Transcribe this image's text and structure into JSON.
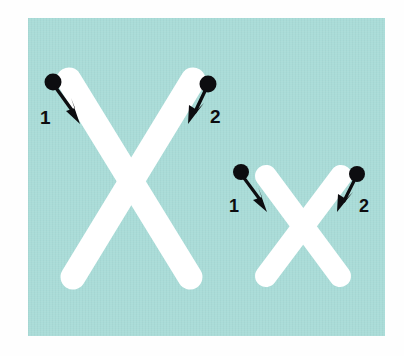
{
  "diagram": {
    "panel_color": "#a9dcd8",
    "letter_color": "#ffffff",
    "ink_color": "#0d0d10",
    "page_background": "#fefefe",
    "letters": [
      {
        "name": "uppercase-x",
        "glyph": "X",
        "case": "uppercase",
        "strokes": [
          {
            "number": "1",
            "label": "1",
            "direction": "down-right",
            "start_dot": [
              53,
              82
            ],
            "tip": [
              79,
              121
            ],
            "label_pos": [
              40,
              117
            ]
          },
          {
            "number": "2",
            "label": "2",
            "direction": "down-left",
            "start_dot": [
              207,
              84
            ],
            "tip": [
              190,
              121
            ],
            "label_pos": [
              211,
              117
            ]
          }
        ]
      },
      {
        "name": "lowercase-x",
        "glyph": "x",
        "case": "lowercase",
        "strokes": [
          {
            "number": "1",
            "label": "1",
            "direction": "down-right",
            "start_dot": [
              241,
              172
            ],
            "tip": [
              266,
              210
            ],
            "label_pos": [
              229,
              206
            ]
          },
          {
            "number": "2",
            "label": "2",
            "direction": "down-left",
            "start_dot": [
              356,
              174
            ],
            "tip": [
              340,
              210
            ],
            "label_pos": [
              360,
              206
            ]
          }
        ]
      }
    ],
    "stroke_numbers": [
      "1",
      "2",
      "1",
      "2"
    ]
  }
}
